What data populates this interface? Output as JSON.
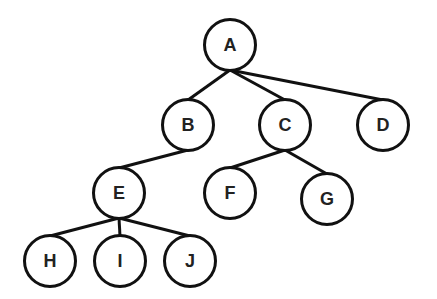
{
  "diagram": {
    "type": "tree",
    "nodes": [
      {
        "id": "A",
        "label": "A",
        "x": 230,
        "y": 45
      },
      {
        "id": "B",
        "label": "B",
        "x": 188,
        "y": 125
      },
      {
        "id": "C",
        "label": "C",
        "x": 285,
        "y": 125
      },
      {
        "id": "D",
        "label": "D",
        "x": 383,
        "y": 125
      },
      {
        "id": "E",
        "label": "E",
        "x": 119,
        "y": 193
      },
      {
        "id": "F",
        "label": "F",
        "x": 230,
        "y": 193
      },
      {
        "id": "G",
        "label": "G",
        "x": 327,
        "y": 199
      },
      {
        "id": "H",
        "label": "H",
        "x": 50,
        "y": 261
      },
      {
        "id": "I",
        "label": "I",
        "x": 120,
        "y": 261
      },
      {
        "id": "J",
        "label": "J",
        "x": 190,
        "y": 261
      }
    ],
    "edges": [
      [
        "A",
        "B"
      ],
      [
        "A",
        "C"
      ],
      [
        "A",
        "D"
      ],
      [
        "B",
        "E"
      ],
      [
        "C",
        "F"
      ],
      [
        "C",
        "G"
      ],
      [
        "E",
        "H"
      ],
      [
        "E",
        "I"
      ],
      [
        "E",
        "J"
      ]
    ],
    "colors": {
      "stroke": "#111111",
      "text": "#222222",
      "background": "#ffffff"
    }
  }
}
